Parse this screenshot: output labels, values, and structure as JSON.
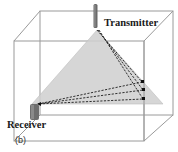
{
  "figure": {
    "caption": "(b)",
    "transmitter_label": "Transmitter",
    "receiver_label": "Receiver",
    "colors": {
      "box_edge": "#9a9a9a",
      "coverage_fill": "#cfcfcf",
      "ray": "#1c1c1c",
      "transmitter": "#6a6a6a",
      "receiver": "#6e6e6e"
    },
    "icons": {
      "transmitter": "transmitter-antenna-icon",
      "receiver": "receiver-icon"
    },
    "ray_count": 3
  }
}
